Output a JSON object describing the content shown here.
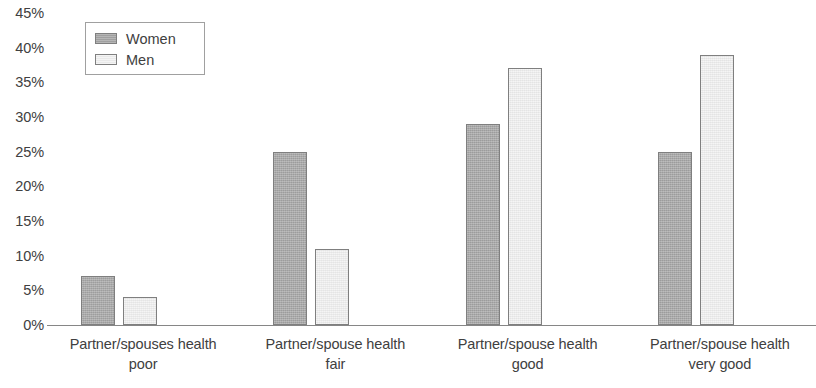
{
  "chart_data": {
    "type": "bar",
    "title": "",
    "subtitle": "",
    "xlabel": "",
    "ylabel": "",
    "ylim": [
      0,
      45
    ],
    "ytick_labels": [
      "45%",
      "40%",
      "35%",
      "30%",
      "25%",
      "20%",
      "15%",
      "10%",
      "5%",
      "0%"
    ],
    "ytick_values": [
      45,
      40,
      35,
      30,
      25,
      20,
      15,
      10,
      5,
      0
    ],
    "grid": false,
    "legend_position": "top-left",
    "value_unit": "%",
    "categories": [
      "Partner/spouses health poor",
      "Partner/spouse health fair",
      "Partner/spouse health good",
      "Partner/spouse health very good"
    ],
    "category_lines": [
      [
        "Partner/spouses health",
        "poor"
      ],
      [
        "Partner/spouse health",
        "fair"
      ],
      [
        "Partner/spouse health",
        "good"
      ],
      [
        "Partner/spouse health",
        "very good"
      ]
    ],
    "series": [
      {
        "name": "Women",
        "color": "#a6a6a6",
        "border_color": "#7f7f7f",
        "values": [
          7,
          25,
          29,
          25
        ]
      },
      {
        "name": "Men",
        "color": "#f2f2f2",
        "border_color": "#7f7f7f",
        "values": [
          4,
          11,
          37,
          39
        ]
      }
    ]
  },
  "axis": {
    "line_color": "#868686"
  }
}
